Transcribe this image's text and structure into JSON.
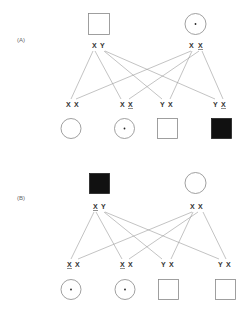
{
  "panels": [
    {
      "label": "(A)",
      "parents": {
        "father": {
          "symbol": "square",
          "affected": false,
          "carrier": false,
          "genotype": [
            {
              "allele": "X",
              "mutant": false
            },
            {
              "allele": "Y",
              "mutant": false
            }
          ]
        },
        "mother": {
          "symbol": "circle",
          "affected": false,
          "carrier": true,
          "genotype": [
            {
              "allele": "X",
              "mutant": false
            },
            {
              "allele": "X",
              "mutant": true
            }
          ]
        }
      },
      "offspring": [
        {
          "symbol": "circle",
          "affected": false,
          "carrier": false,
          "genotype": [
            {
              "allele": "X",
              "mutant": false
            },
            {
              "allele": "X",
              "mutant": false
            }
          ]
        },
        {
          "symbol": "circle",
          "affected": false,
          "carrier": true,
          "genotype": [
            {
              "allele": "X",
              "mutant": false
            },
            {
              "allele": "X",
              "mutant": true
            }
          ]
        },
        {
          "symbol": "square",
          "affected": false,
          "carrier": false,
          "genotype": [
            {
              "allele": "Y",
              "mutant": false
            },
            {
              "allele": "X",
              "mutant": false
            }
          ]
        },
        {
          "symbol": "square",
          "affected": true,
          "carrier": false,
          "genotype": [
            {
              "allele": "Y",
              "mutant": false
            },
            {
              "allele": "X",
              "mutant": true
            }
          ]
        }
      ]
    },
    {
      "label": "(B)",
      "parents": {
        "father": {
          "symbol": "square",
          "affected": true,
          "carrier": false,
          "genotype": [
            {
              "allele": "X",
              "mutant": true
            },
            {
              "allele": "Y",
              "mutant": false
            }
          ]
        },
        "mother": {
          "symbol": "circle",
          "affected": false,
          "carrier": false,
          "genotype": [
            {
              "allele": "X",
              "mutant": false
            },
            {
              "allele": "X",
              "mutant": false
            }
          ]
        }
      },
      "offspring": [
        {
          "symbol": "circle",
          "affected": false,
          "carrier": true,
          "genotype": [
            {
              "allele": "X",
              "mutant": true
            },
            {
              "allele": "X",
              "mutant": false
            }
          ]
        },
        {
          "symbol": "circle",
          "affected": false,
          "carrier": true,
          "genotype": [
            {
              "allele": "X",
              "mutant": true
            },
            {
              "allele": "X",
              "mutant": false
            }
          ]
        },
        {
          "symbol": "square",
          "affected": false,
          "carrier": false,
          "genotype": [
            {
              "allele": "Y",
              "mutant": false
            },
            {
              "allele": "X",
              "mutant": false
            }
          ]
        },
        {
          "symbol": "square",
          "affected": false,
          "carrier": false,
          "genotype": [
            {
              "allele": "Y",
              "mutant": false
            },
            {
              "allele": "X",
              "mutant": false
            }
          ]
        }
      ]
    }
  ],
  "text": {
    "panelA_label": "(A)",
    "panelB_label": "(B)",
    "A_father_a1": "X",
    "A_father_a2": "Y",
    "A_mother_a1": "X",
    "A_mother_a2": "X",
    "A_o1_a1": "X",
    "A_o1_a2": "X",
    "A_o2_a1": "X",
    "A_o2_a2": "X",
    "A_o3_a1": "Y",
    "A_o3_a2": "X",
    "A_o4_a1": "Y",
    "A_o4_a2": "X",
    "B_father_a1": "X",
    "B_father_a2": "Y",
    "B_mother_a1": "X",
    "B_mother_a2": "X",
    "B_o1_a1": "X",
    "B_o1_a2": "X",
    "B_o2_a1": "X",
    "B_o2_a2": "X",
    "B_o3_a1": "Y",
    "B_o3_a2": "X",
    "B_o4_a1": "Y",
    "B_o4_a2": "X"
  }
}
